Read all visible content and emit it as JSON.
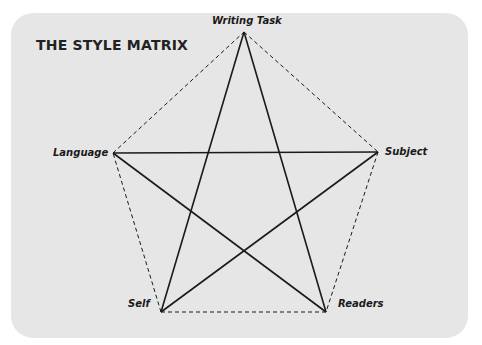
{
  "title": "THE STYLE MATRIX",
  "nodes": [
    {
      "id": "writing-task",
      "label": "Writing Task",
      "x": 244,
      "y": 32
    },
    {
      "id": "subject",
      "label": "Subject",
      "x": 378,
      "y": 152
    },
    {
      "id": "readers",
      "label": "Readers",
      "x": 326,
      "y": 312
    },
    {
      "id": "self",
      "label": "Self",
      "x": 161,
      "y": 312
    },
    {
      "id": "language",
      "label": "Language",
      "x": 113,
      "y": 153
    }
  ],
  "edges": {
    "pentagon_dashed": [
      [
        "writing-task",
        "subject"
      ],
      [
        "subject",
        "readers"
      ],
      [
        "readers",
        "self"
      ],
      [
        "self",
        "language"
      ],
      [
        "language",
        "writing-task"
      ]
    ],
    "star_solid": [
      [
        "writing-task",
        "self"
      ],
      [
        "writing-task",
        "readers"
      ],
      [
        "language",
        "subject"
      ],
      [
        "language",
        "readers"
      ],
      [
        "self",
        "subject"
      ]
    ]
  },
  "colors": {
    "panel": "#e6e6e6",
    "line": "#1a1a1a",
    "background": "#ffffff"
  }
}
